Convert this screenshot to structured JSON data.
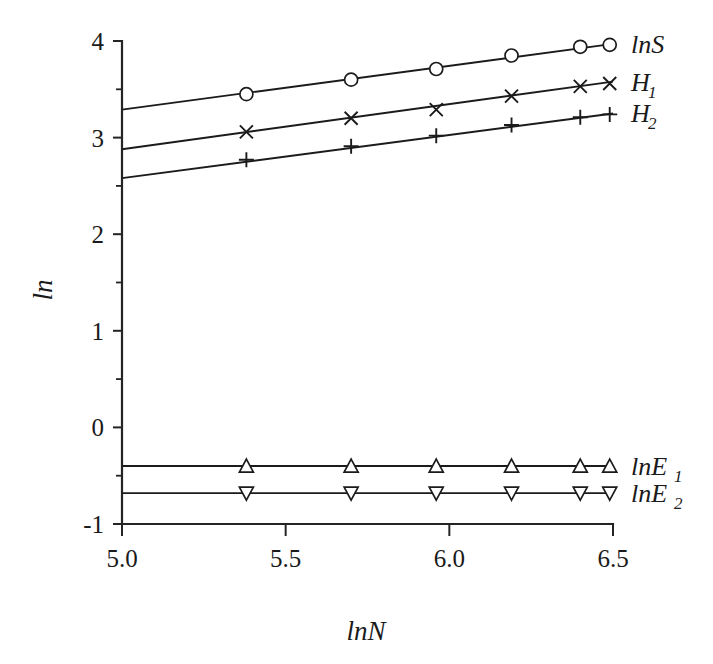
{
  "chart_data": {
    "type": "line",
    "title": "",
    "subtitle": "",
    "xlabel": "lnN",
    "ylabel": "ln",
    "xlim": [
      5.0,
      6.5
    ],
    "ylim": [
      -1,
      4
    ],
    "grid": false,
    "legend_position": "right-inline",
    "x_ticks": [
      "5.0",
      "5.5",
      "6.0",
      "6.5"
    ],
    "x_tick_values": [
      5.0,
      5.5,
      6.0,
      6.5
    ],
    "x_minor_tick_values": [
      5.25,
      5.75,
      6.25
    ],
    "y_ticks": [
      "4",
      "3",
      "2",
      "1",
      "0",
      "-1"
    ],
    "y_tick_values": [
      4,
      3,
      2,
      1,
      0,
      -1
    ],
    "y_minor_tick_values": [
      3.5,
      2.5,
      1.5,
      0.5,
      -0.5
    ],
    "x": [
      5.38,
      5.7,
      5.96,
      6.19,
      6.4,
      6.49
    ],
    "series": [
      {
        "name": "lnS",
        "label_main": "lnS",
        "label_sub": "",
        "marker": "circle",
        "values": [
          3.45,
          3.6,
          3.71,
          3.85,
          3.94,
          3.96
        ],
        "fit_start": [
          5.0,
          3.29
        ],
        "fit_end": [
          6.5,
          3.97
        ]
      },
      {
        "name": "H1",
        "label_main": "H",
        "label_sub": "1",
        "marker": "cross-x",
        "values": [
          3.06,
          3.2,
          3.29,
          3.43,
          3.53,
          3.56
        ],
        "fit_start": [
          5.0,
          2.88
        ],
        "fit_end": [
          6.5,
          3.58
        ]
      },
      {
        "name": "H2",
        "label_main": "H",
        "label_sub": "2",
        "marker": "plus",
        "values": [
          2.77,
          2.91,
          3.02,
          3.13,
          3.21,
          3.24
        ],
        "fit_start": [
          5.0,
          2.58
        ],
        "fit_end": [
          6.5,
          3.25
        ]
      },
      {
        "name": "lnE1",
        "label_main": "lnE",
        "label_sub": "1",
        "marker": "triangle-up",
        "values": [
          -0.4,
          -0.4,
          -0.4,
          -0.4,
          -0.4,
          -0.4
        ],
        "fit_start": [
          5.0,
          -0.4
        ],
        "fit_end": [
          6.5,
          -0.4
        ]
      },
      {
        "name": "lnE2",
        "label_main": "lnE",
        "label_sub": "2",
        "marker": "triangle-down",
        "values": [
          -0.68,
          -0.68,
          -0.68,
          -0.68,
          -0.68,
          -0.68
        ],
        "fit_start": [
          5.0,
          -0.68
        ],
        "fit_end": [
          6.5,
          -0.68
        ]
      }
    ]
  },
  "figure": {
    "background_color": "#ffffff",
    "ink_color": "#1a1a1a"
  }
}
